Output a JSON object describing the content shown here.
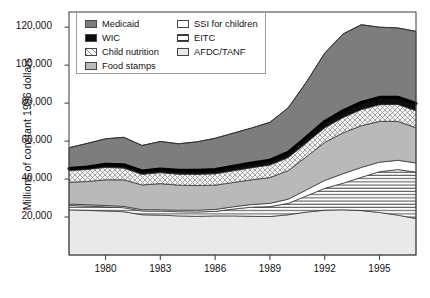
{
  "chart_data": {
    "type": "area",
    "stacked": true,
    "title": "",
    "subtitle": "",
    "xlabel": "",
    "ylabel": "Millions of constant 1996 dollars",
    "xlim": [
      1978,
      1997
    ],
    "ylim": [
      0,
      128000
    ],
    "yticks": [
      20000,
      40000,
      60000,
      80000,
      100000,
      120000
    ],
    "ytick_labels": [
      "20,000",
      "40,000",
      "60,000",
      "80,000",
      "100,000",
      "120,000"
    ],
    "xticks": [
      1980,
      1983,
      1986,
      1989,
      1992,
      1995
    ],
    "xtick_labels": [
      "1980",
      "1983",
      "1986",
      "1989",
      "1992",
      "1995"
    ],
    "grid": false,
    "legend_position": "top-left-inside",
    "x": [
      1978,
      1979,
      1980,
      1981,
      1982,
      1983,
      1984,
      1985,
      1986,
      1987,
      1988,
      1989,
      1990,
      1991,
      1992,
      1993,
      1994,
      1995,
      1996,
      1997
    ],
    "stack_order_bottom_to_top": [
      "AFDC/TANF",
      "EITC",
      "SSI for children",
      "Food stamps",
      "Child nutrition",
      "WIC",
      "Medicaid"
    ],
    "series": [
      {
        "name": "AFDC/TANF",
        "pattern": "solid",
        "color": "#e9e9e9",
        "values": [
          23800,
          23500,
          23200,
          22800,
          21200,
          21000,
          20600,
          20400,
          20600,
          20600,
          20400,
          20300,
          21200,
          22600,
          23600,
          23800,
          23400,
          22400,
          21000,
          19200
        ]
      },
      {
        "name": "EITC",
        "pattern": "horizontal-lines",
        "color": "#ffffff",
        "values": [
          2300,
          2300,
          2200,
          2100,
          2000,
          2100,
          2200,
          2300,
          2400,
          3600,
          4800,
          5200,
          6000,
          8500,
          11500,
          14000,
          17500,
          21500,
          24000,
          24500
        ]
      },
      {
        "name": "SSI for children",
        "pattern": "solid",
        "color": "#ffffff",
        "values": [
          700,
          700,
          700,
          700,
          700,
          700,
          800,
          900,
          1000,
          1200,
          1400,
          1700,
          2200,
          3200,
          4200,
          5000,
          5200,
          5000,
          4900,
          4800
        ]
      },
      {
        "name": "Food stamps",
        "pattern": "solid",
        "color": "#b9b9b9",
        "values": [
          11500,
          12200,
          13500,
          14000,
          13000,
          13800,
          13200,
          13000,
          12800,
          12800,
          13000,
          13600,
          15000,
          17500,
          20000,
          21500,
          22000,
          21500,
          20500,
          18500
        ]
      },
      {
        "name": "Child nutrition",
        "pattern": "crosshatch",
        "color": "#f2f2f2",
        "values": [
          6200,
          6400,
          6600,
          6200,
          5600,
          5800,
          5800,
          5900,
          6000,
          6200,
          6400,
          6600,
          6900,
          7300,
          7700,
          8100,
          8500,
          8800,
          8900,
          9000
        ]
      },
      {
        "name": "WIC",
        "pattern": "solid",
        "color": "#0d0d0d",
        "values": [
          1000,
          1200,
          1500,
          1700,
          1700,
          1900,
          2000,
          2100,
          2200,
          2300,
          2400,
          2500,
          2700,
          3000,
          3300,
          3500,
          3700,
          3800,
          3800,
          3800
        ]
      },
      {
        "name": "Medicaid",
        "pattern": "solid",
        "color": "#7d7d7d",
        "values": [
          11000,
          12500,
          13500,
          14500,
          13500,
          14500,
          14000,
          15000,
          16500,
          17500,
          18500,
          20000,
          23500,
          29000,
          36000,
          40500,
          41000,
          37000,
          36500,
          38000
        ]
      }
    ],
    "total_line": {
      "name": "total-outline",
      "visible": true,
      "values": [
        56500,
        58800,
        61200,
        62000,
        57700,
        59800,
        58600,
        59600,
        61500,
        64200,
        66900,
        69900,
        77500,
        91100,
        106300,
        116400,
        121300,
        120000,
        119600,
        117800
      ]
    },
    "emphasis_line": {
      "name": "wic-top-bold-line",
      "visible": true
    }
  },
  "legend": {
    "items": [
      {
        "label": "Medicaid",
        "swatch": "medicaid-swatch",
        "pattern": "solid",
        "color": "#7d7d7d"
      },
      {
        "label": "WIC",
        "swatch": "wic-swatch",
        "pattern": "solid",
        "color": "#0d0d0d"
      },
      {
        "label": "Child nutrition",
        "swatch": "child-nutrition-swatch",
        "pattern": "crosshatch",
        "color": "#f2f2f2"
      },
      {
        "label": "Food stamps",
        "swatch": "food-stamps-swatch",
        "pattern": "solid",
        "color": "#b9b9b9"
      },
      {
        "label": "SSI for children",
        "swatch": "ssi-swatch",
        "pattern": "solid",
        "color": "#ffffff"
      },
      {
        "label": "EITC",
        "swatch": "eitc-swatch",
        "pattern": "horizontal-lines",
        "color": "#ffffff"
      },
      {
        "label": "AFDC/TANF",
        "swatch": "afdc-tanf-swatch",
        "pattern": "solid",
        "color": "#e9e9e9"
      }
    ]
  }
}
